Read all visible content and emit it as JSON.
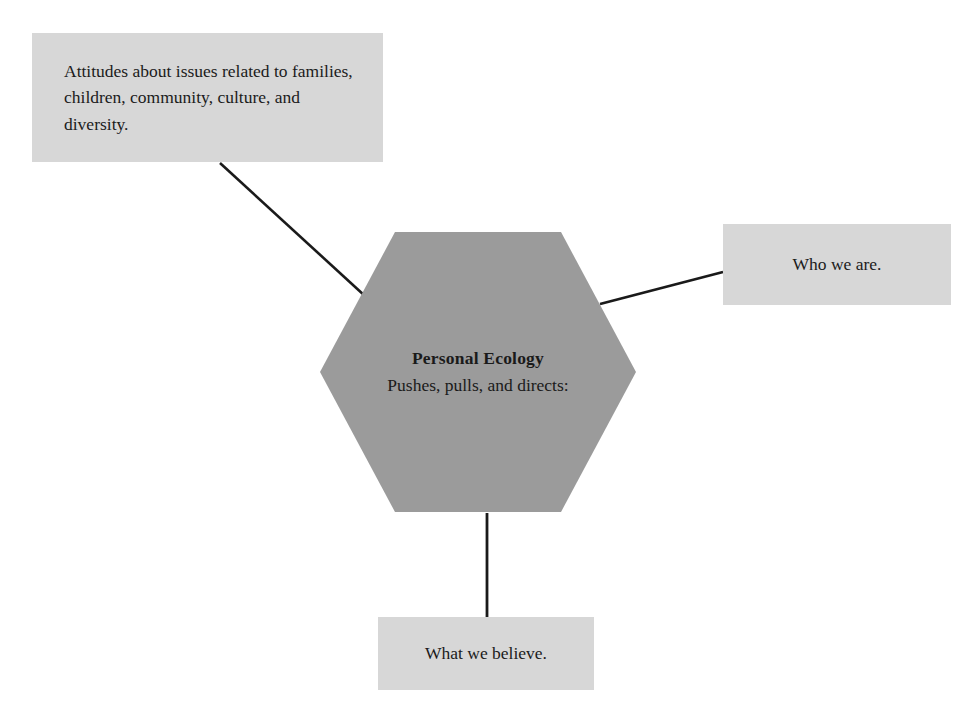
{
  "diagram": {
    "title": "Personal Ecology",
    "center": {
      "label": "Personal Ecology",
      "sublabel": "Pushes, pulls, and directs:",
      "shape": "hexagon",
      "fill_color": "#9b9b9b"
    },
    "nodes": [
      {
        "id": "attitudes",
        "text": "Attitudes about issues related to families, children, community, culture, and diversity.",
        "shape": "rectangle",
        "fill_color": "#d7d7d7",
        "position": "top-left"
      },
      {
        "id": "who-we-are",
        "text": "Who we are.",
        "shape": "rectangle",
        "fill_color": "#d7d7d7",
        "position": "right"
      },
      {
        "id": "what-we-believe",
        "text": "What we believe.",
        "shape": "rectangle",
        "fill_color": "#d7d7d7",
        "position": "bottom"
      }
    ],
    "connectors": [
      {
        "id": "attitudes-to-center",
        "from": "attitudes",
        "to": "center",
        "style": "solid-line",
        "color": "#1a1a1a"
      },
      {
        "id": "center-to-who-we-are",
        "from": "center",
        "to": "who-we-are",
        "style": "solid-line",
        "color": "#1a1a1a"
      },
      {
        "id": "center-to-what-we-believe",
        "from": "center",
        "to": "what-we-believe",
        "style": "solid-line",
        "color": "#1a1a1a"
      }
    ]
  }
}
